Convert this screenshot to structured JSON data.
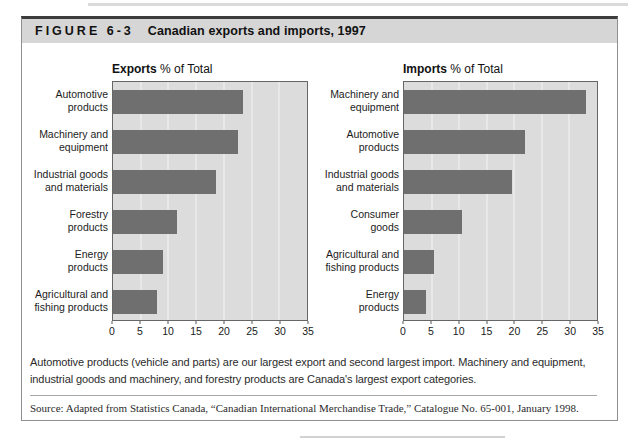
{
  "figure": {
    "label": "FIGURE 6-3",
    "title": "Canadian exports and imports, 1997"
  },
  "colors": {
    "bar": "#6f6f6f",
    "plot_bg": "#dcdcdc",
    "gridline": "#f4f4f4",
    "header_band": "#d6d6d6"
  },
  "chart_data": [
    {
      "type": "bar",
      "orientation": "horizontal",
      "title": "Exports % of Total",
      "title_bold": "Exports",
      "title_rest": " % of Total",
      "categories": [
        "Automotive products",
        "Machinery and equipment",
        "Industrial goods and materials",
        "Forestry products",
        "Energy products",
        "Agricultural and fishing products"
      ],
      "category_lines": [
        [
          "Automotive",
          "products"
        ],
        [
          "Machinery and",
          "equipment"
        ],
        [
          "Industrial goods",
          "and materials"
        ],
        [
          "Forestry",
          "products"
        ],
        [
          "Energy",
          "products"
        ],
        [
          "Agricultural and",
          "fishing products"
        ]
      ],
      "values": [
        23.5,
        22.5,
        18.5,
        11.5,
        9,
        8
      ],
      "xlim": [
        0,
        35
      ],
      "xticks": [
        0,
        5,
        10,
        15,
        20,
        25,
        30,
        35
      ],
      "grid": true,
      "legend": "none"
    },
    {
      "type": "bar",
      "orientation": "horizontal",
      "title": "Imports % of Total",
      "title_bold": "Imports",
      "title_rest": " % of Total",
      "categories": [
        "Machinery and equipment",
        "Automotive products",
        "Industrial goods and materials",
        "Consumer goods",
        "Agricultural and fishing products",
        "Energy products"
      ],
      "category_lines": [
        [
          "Machinery and",
          "equipment"
        ],
        [
          "Automotive",
          "products"
        ],
        [
          "Industrial goods",
          "and materials"
        ],
        [
          "Consumer",
          "goods"
        ],
        [
          "Agricultural and",
          "fishing products"
        ],
        [
          "Energy",
          "products"
        ]
      ],
      "values": [
        33,
        22,
        19.5,
        10.5,
        5.5,
        4
      ],
      "xlim": [
        0,
        35
      ],
      "xticks": [
        0,
        5,
        10,
        15,
        20,
        25,
        30,
        35
      ],
      "grid": true,
      "legend": "none"
    }
  ],
  "caption": "Automotive products (vehicle and parts) are our largest export and second largest import. Machinery and equipment, industrial goods and machinery, and forestry products are Canada's largest export categories.",
  "source": "Source: Adapted from Statistics Canada, “Canadian International Merchandise Trade,” Catalogue No. 65-001, January 1998."
}
